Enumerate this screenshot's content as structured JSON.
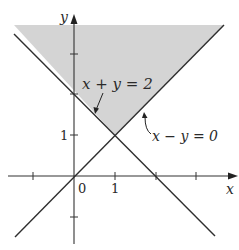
{
  "figure": {
    "type": "inequality-region-plot",
    "shaded_region": "x + y >= 2 and y >= x (region above both lines)",
    "shade_color": "#d4d4d4",
    "line_color": "#2e2e2e"
  },
  "axes": {
    "x_label": "x",
    "y_label": "y",
    "origin_label": "0",
    "x_tick_label": "1",
    "y_tick_label": "1"
  },
  "lines": [
    {
      "equation": "x + y = 2",
      "label": "x + y = 2"
    },
    {
      "equation": "x - y = 0",
      "label": "x − y = 0"
    }
  ],
  "intersection": {
    "x": 1,
    "y": 1
  }
}
